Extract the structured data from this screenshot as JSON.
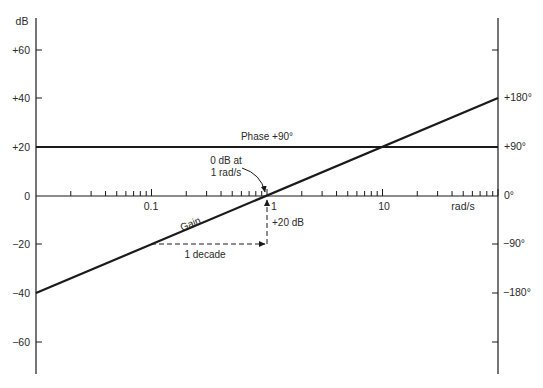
{
  "chart_data": {
    "type": "line",
    "title": "",
    "xlabel": "rad/s",
    "xscale": "log",
    "xlim": [
      0.01,
      100
    ],
    "x_tick_labels": [
      "0.1",
      "1",
      "10"
    ],
    "x_tick_values": [
      0.1,
      1,
      10
    ],
    "ylabel_left": "dB",
    "ylim_left": [
      -70,
      70
    ],
    "y_ticks_left": [
      60,
      40,
      20,
      0,
      -20,
      -40,
      -60
    ],
    "y_tick_labels_left": [
      "+60",
      "+40",
      "+20",
      "0",
      "-20",
      "-40",
      "-60"
    ],
    "ylabel_right": "degrees",
    "y_ticks_right": [
      180,
      90,
      0,
      -90,
      -180
    ],
    "y_tick_labels_right": [
      "+180°",
      "+90°",
      "0°",
      "-90°",
      "-180°"
    ],
    "series": [
      {
        "name": "Gain",
        "axis": "left",
        "unit": "dB",
        "x": [
          0.01,
          0.1,
          1,
          10,
          100
        ],
        "values": [
          -40,
          -20,
          0,
          20,
          40
        ]
      },
      {
        "name": "Phase +90°",
        "axis": "right",
        "unit": "degrees",
        "x": [
          0.01,
          100
        ],
        "values": [
          90,
          90
        ]
      }
    ],
    "annotations": [
      {
        "text": "0 dB at",
        "text2": "1 rad/s",
        "points_to": [
          1,
          0
        ]
      },
      {
        "text": "1 decade",
        "from": 0.1,
        "to": 1,
        "at_db": -20
      },
      {
        "text": "+20 dB",
        "x": 1,
        "from_db": -20,
        "to_db": 0
      }
    ],
    "grid": false,
    "legend": "none (inline labels)"
  },
  "labels": {
    "y_left_unit": "dB",
    "x_unit": "rad/s",
    "gain": "Gain",
    "phase": "Phase +90°",
    "zero_db_line1": "0 dB at",
    "zero_db_line2": "1 rad/s",
    "decade": "1 decade",
    "plus20": "+20 dB",
    "x_one": "1",
    "x_tenth": "0.1",
    "x_ten": "10",
    "yl_p60": "+60",
    "yl_p40": "+40",
    "yl_p20": "+20",
    "yl_0": "0",
    "yl_m20": "−20",
    "yl_m40": "−40",
    "yl_m60": "−60",
    "yr_p180": "+180°",
    "yr_p90": "+90°",
    "yr_0": "0°",
    "yr_m90": "−90°",
    "yr_m180": "−180°"
  },
  "colors": {
    "ink": "#1a1a1a",
    "background": "#ffffff"
  }
}
